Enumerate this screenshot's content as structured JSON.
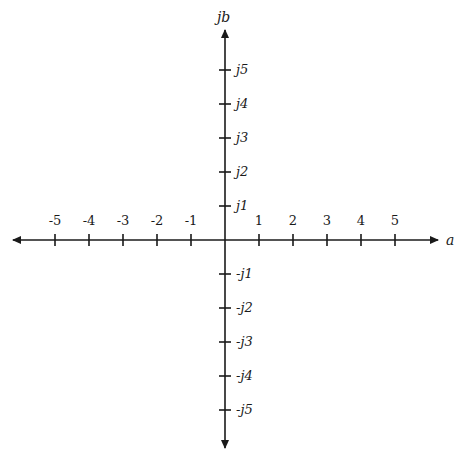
{
  "diagram": {
    "horizontal_axis": {
      "label": "a",
      "ticks": [
        "-5",
        "-4",
        "-3",
        "-2",
        "-1",
        "1",
        "2",
        "3",
        "4",
        "5"
      ]
    },
    "vertical_axis": {
      "label": "jb",
      "ticks_positive": [
        "j1",
        "j2",
        "j3",
        "j4",
        "j5"
      ],
      "ticks_negative": [
        "-j1",
        "-j2",
        "-j3",
        "-j4",
        "-j5"
      ]
    },
    "origin": {
      "x": 225,
      "y": 240
    },
    "tick_spacing": 34,
    "colors": {
      "axis": "#1a1a1a",
      "background": "#ffffff"
    }
  },
  "caption": ""
}
